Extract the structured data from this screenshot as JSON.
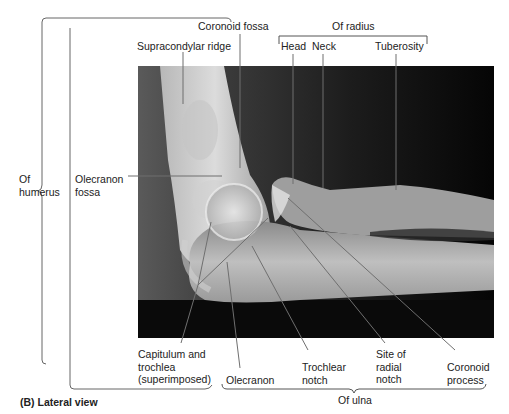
{
  "figure": {
    "caption": "(B) Lateral view",
    "view": "Lateral radiograph of elbow"
  },
  "groups": {
    "humerus": "Of\nhumerus",
    "radius": "Of radius",
    "ulna": "Of ulna"
  },
  "labels": {
    "coronoid_fossa": "Coronoid fossa",
    "supracondylar_ridge": "Supracondylar ridge",
    "olecranon_fossa": "Olecranon\nfossa",
    "head": "Head",
    "neck": "Neck",
    "tuberosity": "Tuberosity",
    "capitulum_trochlea": "Capitulum and\ntrochlea\n(superimposed)",
    "olecranon": "Olecranon",
    "trochlear_notch": "Trochlear\nnotch",
    "site_radial_notch": "Site of\nradial\nnotch",
    "coronoid_process": "Coronoid\nprocess"
  },
  "colors": {
    "background": "#ffffff",
    "xray_dark": "#0d0d0d",
    "bone_light": "#d8d8d8",
    "leader_line": "#555555"
  }
}
